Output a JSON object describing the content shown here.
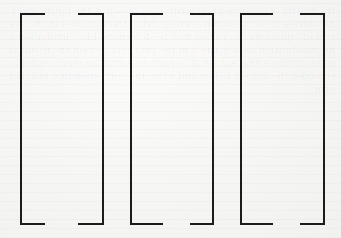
{
  "figure": {
    "line_color": "#1c1c1c",
    "background_color": "#f6f6f4",
    "bracket_groups": [
      {
        "name": "group-1",
        "left": {
          "x": 20,
          "y": 13,
          "width": 25,
          "height": 212
        },
        "right": {
          "x": 78,
          "y": 13,
          "width": 26,
          "height": 212
        }
      },
      {
        "name": "group-2",
        "left": {
          "x": 130,
          "y": 13,
          "width": 33,
          "height": 212
        },
        "right": {
          "x": 190,
          "y": 13,
          "width": 24,
          "height": 212
        }
      },
      {
        "name": "group-3",
        "left": {
          "x": 240,
          "y": 13,
          "width": 33,
          "height": 212
        },
        "right": {
          "x": 300,
          "y": 13,
          "width": 25,
          "height": 212
        }
      }
    ]
  },
  "ghost_text": "the matrix of coefficients is written as shown in the figure and the entries of each column correspond to the variables in the system of equations the values may be determined by elimination and substitution as described in the previous section the result is a set of values that satisfy all equations simultaneously example consider the system below and write the corresponding matrix form"
}
